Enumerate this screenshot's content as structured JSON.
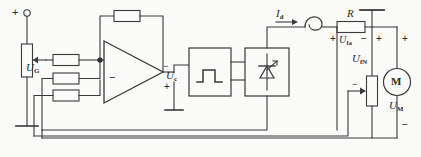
{
  "diagram": {
    "stroke_color": "#3a3a3a",
    "background": "#fbfbfa"
  },
  "labels": {
    "supply_plus": "+",
    "u_g": {
      "symbol": "U",
      "sub": "G"
    },
    "u_c": {
      "symbol": "U",
      "sub": "c"
    },
    "i_d": {
      "symbol": "I",
      "sub": "d"
    },
    "r": "R",
    "u_ia": {
      "symbol": "U",
      "sub": "Ia"
    },
    "u_fn": {
      "symbol": "U",
      "sub": "fN"
    },
    "u_m": {
      "symbol": "U",
      "sub": "M"
    },
    "motor": "M"
  },
  "polarity": {
    "opamp_inverting": "−",
    "opamp_out_minus": "−",
    "opamp_out_plus": "+",
    "r_left_plus": "+",
    "r_right_minus": "−",
    "ufn_top_plus": "+",
    "ufn_wiper_minus": "−",
    "motor_plus": "+",
    "motor_minus": "−"
  },
  "components": [
    {
      "name": "potentiometer-ug",
      "type": "potentiometer",
      "label": "U_G"
    },
    {
      "name": "input-resistor-1",
      "type": "resistor"
    },
    {
      "name": "input-resistor-2",
      "type": "resistor"
    },
    {
      "name": "input-resistor-3",
      "type": "resistor"
    },
    {
      "name": "feedback-resistor",
      "type": "resistor"
    },
    {
      "name": "operational-amplifier",
      "type": "opamp",
      "output": "U_c"
    },
    {
      "name": "pulse-generator",
      "type": "block",
      "symbol": "pulse"
    },
    {
      "name": "thyristor-converter",
      "type": "block",
      "symbol": "thyristor"
    },
    {
      "name": "smoothing-inductor",
      "type": "inductor",
      "current": "I_d"
    },
    {
      "name": "shunt-resistor-r",
      "type": "resistor",
      "label": "R",
      "voltage": "U_Ia"
    },
    {
      "name": "potentiometer-ufn",
      "type": "potentiometer",
      "label": "U_fN"
    },
    {
      "name": "dc-motor",
      "type": "motor",
      "label": "M",
      "voltage": "U_M"
    },
    {
      "name": "ground-opamp",
      "type": "ground"
    },
    {
      "name": "ground-supply-left",
      "type": "ground"
    },
    {
      "name": "ground-supply-right",
      "type": "ground"
    }
  ]
}
